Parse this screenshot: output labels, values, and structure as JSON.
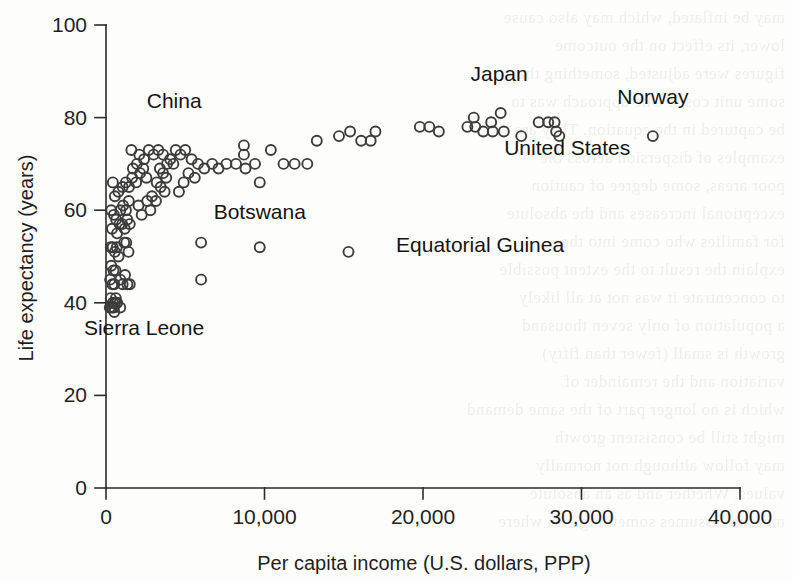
{
  "page": {
    "background_color": "#fdfdfc",
    "ink_color": "#2b2b2b",
    "bleed_through_text": "may be inflated, which may also cause\nlower, its effect on the outcome\nfigures were adjusted, something that\nsome unit costs. One approach was to\nbe captured in the equation. They are\nexamples of dispersion across the\npoor areas, some degree of caution\nexceptional increases and the absolute\nfor families who come into the\nexplain the result to the extent possible\nto concentrate it was not at all likely\na population of only seven thousand\ngrowth is small (fewer than fifty)\nvariation and the remainder of\nwhich is no longer part of the same demand\nmight still be consistent growth\nmay follow although not normally\nvalues. Whether and as an absolute\nmeasure assumes something else where\n"
  },
  "chart_data": {
    "type": "scatter",
    "title": "",
    "xlabel": "Per capita income (U.S. dollars, PPP)",
    "ylabel": "Life expectancy (years)",
    "xlim": [
      0,
      40000
    ],
    "ylim": [
      0,
      100
    ],
    "xticks": [
      0,
      10000,
      20000,
      30000,
      40000
    ],
    "xtick_labels": [
      "0",
      "10,000",
      "20,000",
      "30,000",
      "40,000"
    ],
    "yticks": [
      0,
      20,
      40,
      60,
      80,
      100
    ],
    "ytick_labels": [
      "0",
      "20",
      "40",
      "60",
      "80",
      "100"
    ],
    "grid": false,
    "legend": null,
    "marker": {
      "shape": "open-circle",
      "radius_px": 5,
      "stroke": "#3c3c3c",
      "fill": "none"
    },
    "annotations": [
      {
        "label": "China",
        "x": 4300,
        "y": 82,
        "anchor": "middle",
        "target_point": {
          "x": 4300,
          "y": 72
        }
      },
      {
        "label": "Japan",
        "x": 24800,
        "y": 88,
        "anchor": "middle",
        "target_point": {
          "x": 24800,
          "y": 81
        }
      },
      {
        "label": "Norway",
        "x": 34500,
        "y": 83,
        "anchor": "middle",
        "target_point": {
          "x": 34500,
          "y": 76
        }
      },
      {
        "label": "United States",
        "x": 29100,
        "y": 72,
        "anchor": "middle",
        "target_point": {
          "x": 28400,
          "y": 77
        }
      },
      {
        "label": "Botswana",
        "x": 9700,
        "y": 58,
        "anchor": "middle",
        "target_point": {
          "x": 9700,
          "y": 52
        }
      },
      {
        "label": "Sierra Leone",
        "x": 2400,
        "y": 33,
        "anchor": "middle",
        "target_point": {
          "x": 700,
          "y": 40
        }
      },
      {
        "label": "Equatorial Guinea",
        "x": 18300,
        "y": 51,
        "anchor": "start",
        "target_point": {
          "x": 15300,
          "y": 51
        }
      }
    ],
    "points": [
      {
        "x": 430,
        "y": 66
      },
      {
        "x": 560,
        "y": 63
      },
      {
        "x": 330,
        "y": 60
      },
      {
        "x": 500,
        "y": 59
      },
      {
        "x": 640,
        "y": 58
      },
      {
        "x": 380,
        "y": 56
      },
      {
        "x": 700,
        "y": 55
      },
      {
        "x": 850,
        "y": 57
      },
      {
        "x": 300,
        "y": 52
      },
      {
        "x": 420,
        "y": 52
      },
      {
        "x": 560,
        "y": 51
      },
      {
        "x": 680,
        "y": 52
      },
      {
        "x": 790,
        "y": 50
      },
      {
        "x": 330,
        "y": 48
      },
      {
        "x": 470,
        "y": 47
      },
      {
        "x": 600,
        "y": 47
      },
      {
        "x": 260,
        "y": 45
      },
      {
        "x": 400,
        "y": 44
      },
      {
        "x": 520,
        "y": 44
      },
      {
        "x": 300,
        "y": 41
      },
      {
        "x": 430,
        "y": 40
      },
      {
        "x": 560,
        "y": 40
      },
      {
        "x": 680,
        "y": 40
      },
      {
        "x": 240,
        "y": 39
      },
      {
        "x": 380,
        "y": 39
      },
      {
        "x": 520,
        "y": 38
      },
      {
        "x": 900,
        "y": 45
      },
      {
        "x": 1050,
        "y": 44
      },
      {
        "x": 1200,
        "y": 46
      },
      {
        "x": 1350,
        "y": 44
      },
      {
        "x": 1500,
        "y": 44
      },
      {
        "x": 1150,
        "y": 53
      },
      {
        "x": 1280,
        "y": 53
      },
      {
        "x": 1420,
        "y": 51
      },
      {
        "x": 1020,
        "y": 57
      },
      {
        "x": 1180,
        "y": 56
      },
      {
        "x": 1340,
        "y": 58
      },
      {
        "x": 1500,
        "y": 57
      },
      {
        "x": 900,
        "y": 60
      },
      {
        "x": 1080,
        "y": 61
      },
      {
        "x": 1260,
        "y": 60
      },
      {
        "x": 1440,
        "y": 62
      },
      {
        "x": 780,
        "y": 64
      },
      {
        "x": 1050,
        "y": 65
      },
      {
        "x": 1250,
        "y": 66
      },
      {
        "x": 1450,
        "y": 65
      },
      {
        "x": 1650,
        "y": 67
      },
      {
        "x": 1900,
        "y": 66
      },
      {
        "x": 1700,
        "y": 69
      },
      {
        "x": 1950,
        "y": 70
      },
      {
        "x": 2150,
        "y": 68
      },
      {
        "x": 2350,
        "y": 69
      },
      {
        "x": 2550,
        "y": 67
      },
      {
        "x": 2100,
        "y": 72
      },
      {
        "x": 2400,
        "y": 71
      },
      {
        "x": 1600,
        "y": 73
      },
      {
        "x": 2700,
        "y": 73
      },
      {
        "x": 3000,
        "y": 72
      },
      {
        "x": 3300,
        "y": 73
      },
      {
        "x": 3600,
        "y": 72
      },
      {
        "x": 3850,
        "y": 70
      },
      {
        "x": 4050,
        "y": 71
      },
      {
        "x": 4250,
        "y": 70
      },
      {
        "x": 3400,
        "y": 69
      },
      {
        "x": 3600,
        "y": 68
      },
      {
        "x": 3800,
        "y": 67
      },
      {
        "x": 3200,
        "y": 66
      },
      {
        "x": 3450,
        "y": 65
      },
      {
        "x": 3700,
        "y": 64
      },
      {
        "x": 2900,
        "y": 63
      },
      {
        "x": 3150,
        "y": 62
      },
      {
        "x": 2600,
        "y": 62
      },
      {
        "x": 2800,
        "y": 60
      },
      {
        "x": 2250,
        "y": 59
      },
      {
        "x": 2050,
        "y": 61
      },
      {
        "x": 4400,
        "y": 73
      },
      {
        "x": 4700,
        "y": 72
      },
      {
        "x": 5000,
        "y": 73
      },
      {
        "x": 5400,
        "y": 71
      },
      {
        "x": 5800,
        "y": 70
      },
      {
        "x": 6200,
        "y": 69
      },
      {
        "x": 6700,
        "y": 70
      },
      {
        "x": 7100,
        "y": 69
      },
      {
        "x": 5200,
        "y": 68
      },
      {
        "x": 4900,
        "y": 66
      },
      {
        "x": 4600,
        "y": 64
      },
      {
        "x": 5600,
        "y": 67
      },
      {
        "x": 7600,
        "y": 70
      },
      {
        "x": 8200,
        "y": 70
      },
      {
        "x": 8800,
        "y": 69
      },
      {
        "x": 8700,
        "y": 74
      },
      {
        "x": 8700,
        "y": 72
      },
      {
        "x": 9400,
        "y": 70
      },
      {
        "x": 10400,
        "y": 73
      },
      {
        "x": 11200,
        "y": 70
      },
      {
        "x": 11900,
        "y": 70
      },
      {
        "x": 12700,
        "y": 70
      },
      {
        "x": 9700,
        "y": 66
      },
      {
        "x": 13300,
        "y": 75
      },
      {
        "x": 14700,
        "y": 76
      },
      {
        "x": 15400,
        "y": 77
      },
      {
        "x": 16100,
        "y": 75
      },
      {
        "x": 17000,
        "y": 77
      },
      {
        "x": 16700,
        "y": 75
      },
      {
        "x": 19800,
        "y": 78
      },
      {
        "x": 20400,
        "y": 78
      },
      {
        "x": 21000,
        "y": 77
      },
      {
        "x": 22800,
        "y": 78
      },
      {
        "x": 23300,
        "y": 78
      },
      {
        "x": 23200,
        "y": 80
      },
      {
        "x": 23800,
        "y": 77
      },
      {
        "x": 24300,
        "y": 79
      },
      {
        "x": 24400,
        "y": 77
      },
      {
        "x": 25100,
        "y": 77
      },
      {
        "x": 24900,
        "y": 81
      },
      {
        "x": 26200,
        "y": 76
      },
      {
        "x": 27300,
        "y": 79
      },
      {
        "x": 27900,
        "y": 79
      },
      {
        "x": 28400,
        "y": 77
      },
      {
        "x": 28300,
        "y": 79
      },
      {
        "x": 28600,
        "y": 76
      },
      {
        "x": 34500,
        "y": 76
      },
      {
        "x": 6000,
        "y": 53
      },
      {
        "x": 9700,
        "y": 52
      },
      {
        "x": 15300,
        "y": 51
      },
      {
        "x": 6000,
        "y": 45
      },
      {
        "x": 700,
        "y": 40
      },
      {
        "x": 500,
        "y": 39
      },
      {
        "x": 900,
        "y": 39
      },
      {
        "x": 620,
        "y": 41
      }
    ]
  }
}
